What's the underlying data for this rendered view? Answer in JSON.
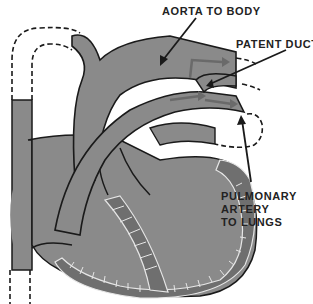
{
  "diagram": {
    "type": "anatomical-illustration",
    "colors": {
      "vessel_fill": "#8a8a8a",
      "outline": "#1a1a1a",
      "muscle_wall": "#6f6f6f",
      "muscle_stripe": "#e6e6e6",
      "background": "#ffffff"
    },
    "labels": {
      "aorta": "AORTA TO BODY",
      "patent_duct": "PATENT DUCT",
      "pulmonary": {
        "line1": "PULMONARY",
        "line2": "ARTERY",
        "line3": "TO LUNGS"
      }
    }
  }
}
